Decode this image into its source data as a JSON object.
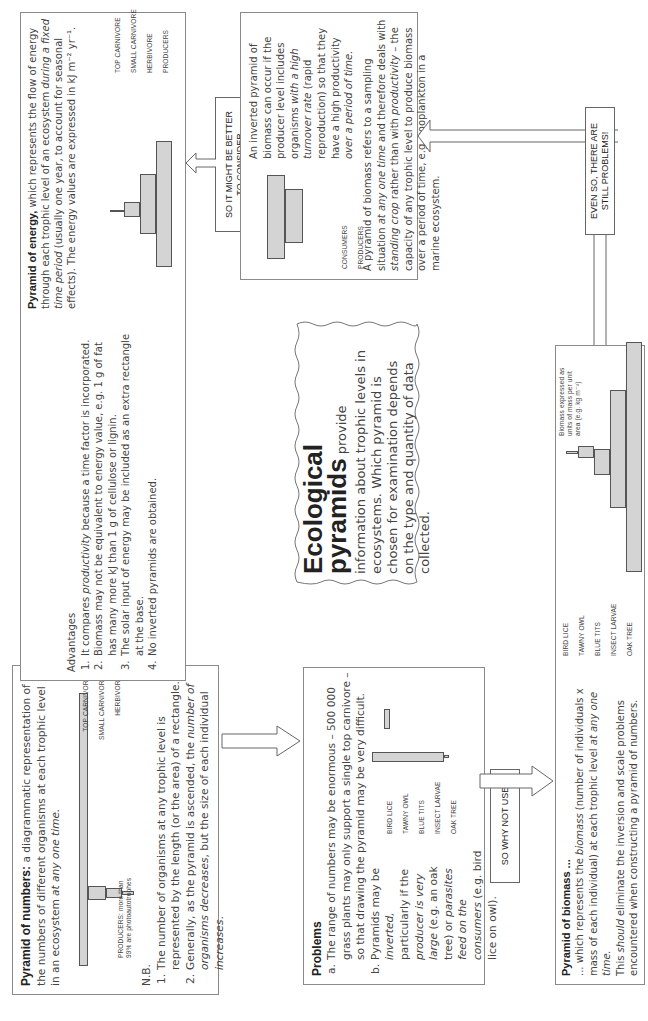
{
  "numbers": {
    "title": "Pyramid of numbers:",
    "intro": " a diagrammatic representation of the numbers of different organisms at each trophic level in an ecosystem ",
    "intro_italic": "at any one time.",
    "levels": [
      "TOP CARNIVORE",
      "SMALL CARNIVORE",
      "HERBIVORE"
    ],
    "producer_note": [
      "PRODUCERS: more than",
      "99% are photoautotrophes"
    ],
    "nb_label": "N.B.",
    "nb_items": [
      {
        "n": "1.",
        "text": "The number of organisms at any trophic level is represented by the length (or the area) of a rectangle."
      },
      {
        "n": "2.",
        "text_a": "Generally, as the pyramid is ascended, the ",
        "italic_a": "number of organisms decreases",
        "text_b": ", but the size of each individual ",
        "italic_b": "increases",
        "text_c": "."
      }
    ]
  },
  "problems": {
    "title": "Problems",
    "item_a_label": "a.",
    "item_a": "The range of numbers may be enormous – 500 000 grass plants may only support a single top carnivore – so that drawing the pyramid may be very difficult.",
    "item_b_label": "b.",
    "item_b_parts": [
      "Pyramids may be ",
      "inverted,",
      " particularly if the ",
      "producer is very large",
      " (e.g. an oak tree) or ",
      "parasites feed on the consumers",
      " (e.g. bird lice on owl)."
    ],
    "levels": [
      "BIRD LICE",
      "TAWNY OWL",
      "BLUE TITS",
      "INSECT LARVAE",
      "OAK TREE"
    ]
  },
  "arrows": {
    "so_why_not_use": "SO WHY NOT USE",
    "so_it_might_be_better": [
      "SO IT MIGHT BE BETTER",
      "TO CONSIDER"
    ],
    "even_so": [
      "EVEN SO, THERE ARE",
      "STILL PROBLEMS!"
    ]
  },
  "biomass": {
    "title": "Pyramid of biomass ...",
    "line1_a": "... which represents the ",
    "line1_italic": "biomass",
    "line1_b": " (number of individuals x mass of each individual) at each trophic level ",
    "line1_italic2": "at any one time.",
    "line2_a": "This ",
    "line2_italic": "should",
    "line2_b": " eliminate the inversion and scale problems encountered when constructing a pyramid of numbers.",
    "levels": [
      "BIRD LICE",
      "TAWNY OWL",
      "BLUE TITS",
      "INSECT LARVAE",
      "OAK TREE"
    ],
    "unit_note": [
      "Biomass expressed as",
      "units of mass per unit",
      "area (e.g. kg m⁻²)"
    ]
  },
  "ecological": {
    "heading_1": "Ecological",
    "heading_2": "pyramids",
    "body_inline": " provide",
    "body": "information about trophic levels in ecosystems. Which pyramid is chosen for examination depends on the type and quantity of data collected."
  },
  "energy": {
    "title": "Pyramid of energy,",
    "intro_a": " which represents the flow of energy through each trophic level of an ecosystem ",
    "intro_italic": "during a fixed time period",
    "intro_b": " (usually one year, to account for seasonal effects). The energy values are expressed in kJ m⁻² yr⁻¹.",
    "levels": [
      "TOP CARNIVORE",
      "SMALL CARNIVORE",
      "HERBIVORE",
      "PRODUCERS"
    ],
    "advantages_label": "Advantages",
    "advantages": [
      {
        "n": "1.",
        "a": "It compares ",
        "i": "productivity",
        "b": " because a time factor is incorporated."
      },
      {
        "n": "2.",
        "a": "Biomass may not be equivalent to energy value, e.g. 1 g of fat has many more kJ than 1 g of cellulose or lignin.",
        "i": "",
        "b": ""
      },
      {
        "n": "3.",
        "a": "The solar input of energy may be included as an extra rectangle at the base.",
        "i": "",
        "b": ""
      },
      {
        "n": "4.",
        "a": "No inverted pyramids are obtained.",
        "i": "",
        "b": ""
      }
    ]
  },
  "inverted": {
    "levels": [
      "CONSUMERS",
      "PRODUCERS"
    ],
    "p1_parts": [
      "An inverted pyramid of biomass can occur if the producer level includes organisms ",
      "with a high turnover rate",
      " (rapid reproduction) so that they have a high productivity ",
      "over a period of time."
    ],
    "p2_parts": [
      "A pyramid of biomass refers to a sampling situation ",
      "at any one time",
      " and therefore deals with ",
      "standing crop",
      " rather than with ",
      "productivity",
      " – the capacity of any trophic level to produce biomass over a period of time, e.g. zooplankton in a marine ecosystem."
    ]
  }
}
